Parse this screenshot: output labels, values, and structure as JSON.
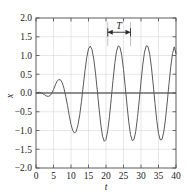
{
  "chart_data": {
    "type": "line",
    "title": "",
    "subtitle": "",
    "xlabel": "t",
    "ylabel": "x",
    "xlim": [
      0,
      40
    ],
    "ylim": [
      -2.0,
      2.0
    ],
    "xticks": [
      0,
      5,
      10,
      15,
      20,
      25,
      30,
      35,
      40
    ],
    "xticklabels": [
      "0",
      "5",
      "10",
      "15",
      "20",
      "25",
      "30",
      "35",
      "40"
    ],
    "yticks": [
      -2.0,
      -1.5,
      -1.0,
      -0.5,
      0.0,
      0.5,
      1.0,
      1.5,
      2.0
    ],
    "yticklabels": [
      "-2.0",
      "-1.5",
      "-1.0",
      "-0.5",
      "0.0",
      "0.5",
      "1.0",
      "1.5",
      "2.0"
    ],
    "grid": true,
    "legend": null,
    "legend_position": "none",
    "line_color": "#5a5a5a",
    "grid_color": "#cfcfcf",
    "frame_color": "#4a4a4a",
    "zero_line": 0.0,
    "annotations": [
      {
        "name": "period-marker",
        "label": "T",
        "type": "double-arrow-span",
        "x_start": 20.5,
        "x_end": 27.0,
        "y": 1.62,
        "label_x": 23.75,
        "label_y": 1.78
      }
    ],
    "series": [
      {
        "name": "x(t)",
        "description": "driven oscillator response: transient beat growing into steady-state oscillation",
        "steady_amplitude_peak": 1.25,
        "steady_amplitude_trough": -1.28,
        "period": 6.5,
        "x": [
          0.0,
          0.5,
          1.0,
          1.5,
          2.0,
          2.5,
          3.0,
          3.5,
          4.0,
          4.5,
          5.0,
          5.5,
          6.0,
          6.5,
          7.0,
          7.5,
          8.0,
          8.5,
          9.0,
          9.5,
          10.0,
          10.5,
          11.0,
          11.5,
          12.0,
          12.5,
          13.0,
          13.5,
          14.0,
          14.5,
          15.0,
          15.5,
          16.0,
          16.5,
          17.0,
          17.5,
          18.0,
          18.5,
          19.0,
          19.5,
          20.0,
          20.5,
          21.0,
          21.5,
          22.0,
          22.5,
          23.0,
          23.5,
          24.0,
          24.5,
          25.0,
          25.5,
          26.0,
          26.5,
          27.0,
          27.5,
          28.0,
          28.5,
          29.0,
          29.5,
          30.0,
          30.5,
          31.0,
          31.5,
          32.0,
          32.5,
          33.0,
          33.5,
          34.0,
          34.5,
          35.0,
          35.5,
          36.0,
          36.5,
          37.0,
          37.5,
          38.0,
          38.5,
          39.0,
          39.5,
          40.0
        ],
        "y": [
          0.0,
          0.01,
          0.02,
          0.01,
          -0.02,
          -0.05,
          -0.08,
          -0.09,
          -0.07,
          -0.01,
          0.09,
          0.21,
          0.31,
          0.36,
          0.35,
          0.27,
          0.12,
          -0.09,
          -0.33,
          -0.6,
          -0.84,
          -1.0,
          -1.07,
          -1.02,
          -0.85,
          -0.58,
          -0.22,
          0.19,
          0.6,
          0.95,
          1.18,
          1.25,
          1.16,
          0.91,
          0.53,
          0.08,
          -0.4,
          -0.83,
          -1.15,
          -1.29,
          -1.24,
          -1.0,
          -0.62,
          -0.15,
          0.34,
          0.78,
          1.11,
          1.26,
          1.22,
          1.0,
          0.63,
          0.17,
          -0.32,
          -0.77,
          -1.11,
          -1.27,
          -1.24,
          -1.02,
          -0.65,
          -0.19,
          0.3,
          0.75,
          1.09,
          1.26,
          1.24,
          1.03,
          0.67,
          0.21,
          -0.28,
          -0.73,
          -1.08,
          -1.25,
          -1.24,
          -1.04,
          -0.69,
          -0.24,
          0.25,
          0.7,
          1.05,
          1.23,
          1.05
        ]
      }
    ]
  },
  "figure": {
    "axis_label_x": "t",
    "axis_label_y": "x",
    "period_label": "T"
  }
}
